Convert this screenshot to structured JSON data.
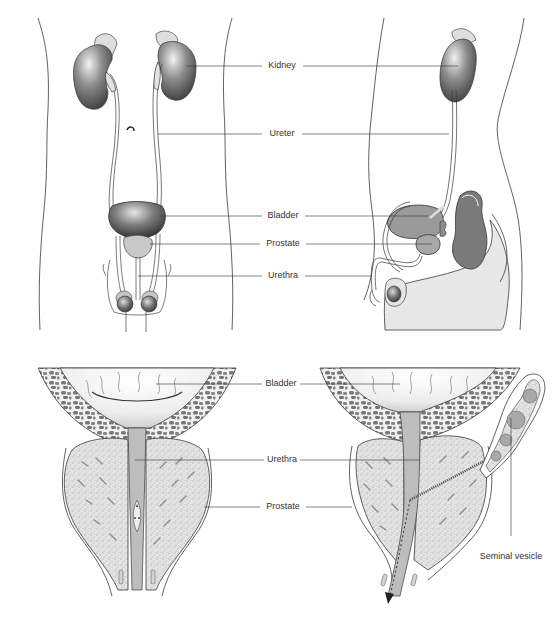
{
  "figure": {
    "top_panel": {
      "labels": {
        "kidney": "Kidney",
        "ureter": "Ureter",
        "bladder": "Bladder",
        "prostate": "Prostate",
        "urethra": "Urethra"
      }
    },
    "bottom_panel": {
      "labels": {
        "bladder": "Bladder",
        "urethra": "Urethra",
        "prostate": "Prostate",
        "seminal_vesicle": "Seminal vesicle"
      }
    }
  },
  "colors": {
    "outline": "#3a3a3a",
    "organ_dark": "#4a4a4a",
    "organ_mid": "#8c8c8c",
    "organ_light": "#cfcfcf",
    "tissue_light": "#e6e6e6",
    "prostate_stipple": "#d8d8d8",
    "muscle_cells": "#7a7a7a",
    "background": "#ffffff"
  }
}
